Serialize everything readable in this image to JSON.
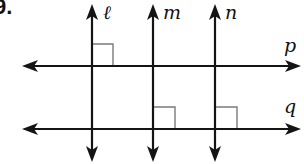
{
  "problem": {
    "number_label": "9."
  },
  "diagram": {
    "colors": {
      "line": "#141414",
      "right_angle_mark": "#7a7a7a",
      "background": "#ffffff"
    },
    "vertical_lines": [
      {
        "name": "l",
        "label": "ℓ",
        "x": 92
      },
      {
        "name": "m",
        "label": "m",
        "x": 153
      },
      {
        "name": "n",
        "label": "n",
        "x": 215
      }
    ],
    "horizontal_lines": [
      {
        "name": "p",
        "label": "p",
        "y": 66
      },
      {
        "name": "q",
        "label": "q",
        "y": 129
      }
    ],
    "right_angles": [
      {
        "at": "l ∩ p",
        "position": "upper-right"
      },
      {
        "at": "m ∩ q",
        "position": "upper-right"
      },
      {
        "at": "n ∩ q",
        "position": "upper-right"
      }
    ]
  }
}
